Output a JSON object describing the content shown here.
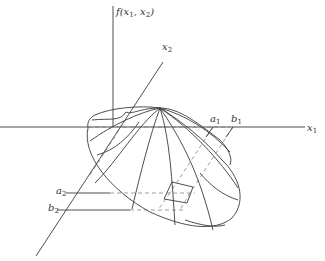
{
  "diagram": {
    "type": "3d-surface-plot",
    "labels": {
      "f_axis": "f(x",
      "f_sub1": "1",
      "f_mid": ", x",
      "f_sub2": "2",
      "f_end": ")",
      "x1_axis": "x",
      "x1_sub": "1",
      "x2_axis": "x",
      "x2_sub": "2",
      "a1": "a",
      "a1_sub": "1",
      "b1": "b",
      "b1_sub": "1",
      "a2": "a",
      "a2_sub": "2",
      "b2": "b",
      "b2_sub": "2"
    },
    "colors": {
      "line": "#3a3a3a",
      "dashed": "#777777",
      "background": "#ffffff"
    }
  }
}
